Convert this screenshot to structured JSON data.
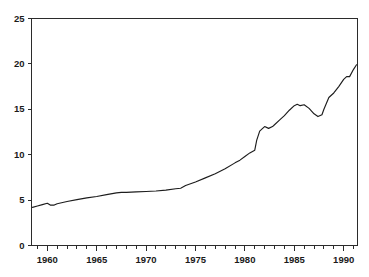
{
  "chart_data": {
    "type": "line",
    "title": "",
    "subtitle": "",
    "xlabel": "",
    "ylabel": "",
    "xlim": [
      1958.4,
      1991.4
    ],
    "ylim": [
      0,
      25
    ],
    "grid": false,
    "legend": null,
    "annotations": [],
    "y_ticks": [
      0,
      5,
      10,
      15,
      20,
      25
    ],
    "y_tick_labels": [
      "0",
      "5",
      "10",
      "15",
      "20",
      "25"
    ],
    "x_ticks": [
      1960,
      1965,
      1970,
      1975,
      1980,
      1985,
      1990
    ],
    "x_tick_labels": [
      "1960",
      "1965",
      "1970",
      "1975",
      "1980",
      "1985",
      "1990"
    ],
    "x_minor_tick_step": 1,
    "x_minor_ticks": [
      1959,
      1960,
      1961,
      1962,
      1963,
      1964,
      1965,
      1966,
      1967,
      1968,
      1969,
      1970,
      1971,
      1972,
      1973,
      1974,
      1975,
      1976,
      1977,
      1978,
      1979,
      1980,
      1981,
      1982,
      1983,
      1984,
      1985,
      1986,
      1987,
      1988,
      1989,
      1990,
      1991
    ],
    "series": [
      {
        "name": "series-1",
        "color": "#1d1d1d",
        "x": [
          1958.5,
          1959.0,
          1959.5,
          1960.0,
          1960.3,
          1960.7,
          1961.0,
          1962.0,
          1963.0,
          1964.0,
          1965.0,
          1966.0,
          1967.0,
          1967.5,
          1968.0,
          1969.0,
          1970.0,
          1971.0,
          1972.0,
          1973.0,
          1973.5,
          1974.0,
          1975.0,
          1976.0,
          1977.0,
          1978.0,
          1979.0,
          1979.5,
          1980.0,
          1980.5,
          1981.0,
          1981.2,
          1981.5,
          1981.8,
          1982.0,
          1982.4,
          1982.8,
          1983.0,
          1983.5,
          1984.0,
          1984.5,
          1985.0,
          1985.3,
          1985.6,
          1986.0,
          1986.5,
          1987.0,
          1987.4,
          1987.8,
          1988.0,
          1988.5,
          1989.0,
          1989.5,
          1990.0,
          1990.3,
          1990.6,
          1991.0,
          1991.3
        ],
        "y": [
          4.2,
          4.35,
          4.5,
          4.65,
          4.45,
          4.45,
          4.6,
          4.85,
          5.05,
          5.25,
          5.4,
          5.6,
          5.8,
          5.85,
          5.85,
          5.9,
          5.95,
          6.0,
          6.1,
          6.25,
          6.3,
          6.6,
          7.0,
          7.45,
          7.9,
          8.45,
          9.1,
          9.4,
          9.8,
          10.2,
          10.5,
          11.6,
          12.6,
          12.9,
          13.1,
          12.9,
          13.1,
          13.3,
          13.8,
          14.3,
          14.9,
          15.4,
          15.55,
          15.4,
          15.5,
          15.1,
          14.5,
          14.2,
          14.4,
          15.0,
          16.3,
          16.8,
          17.5,
          18.3,
          18.6,
          18.6,
          19.4,
          19.9
        ]
      }
    ]
  }
}
